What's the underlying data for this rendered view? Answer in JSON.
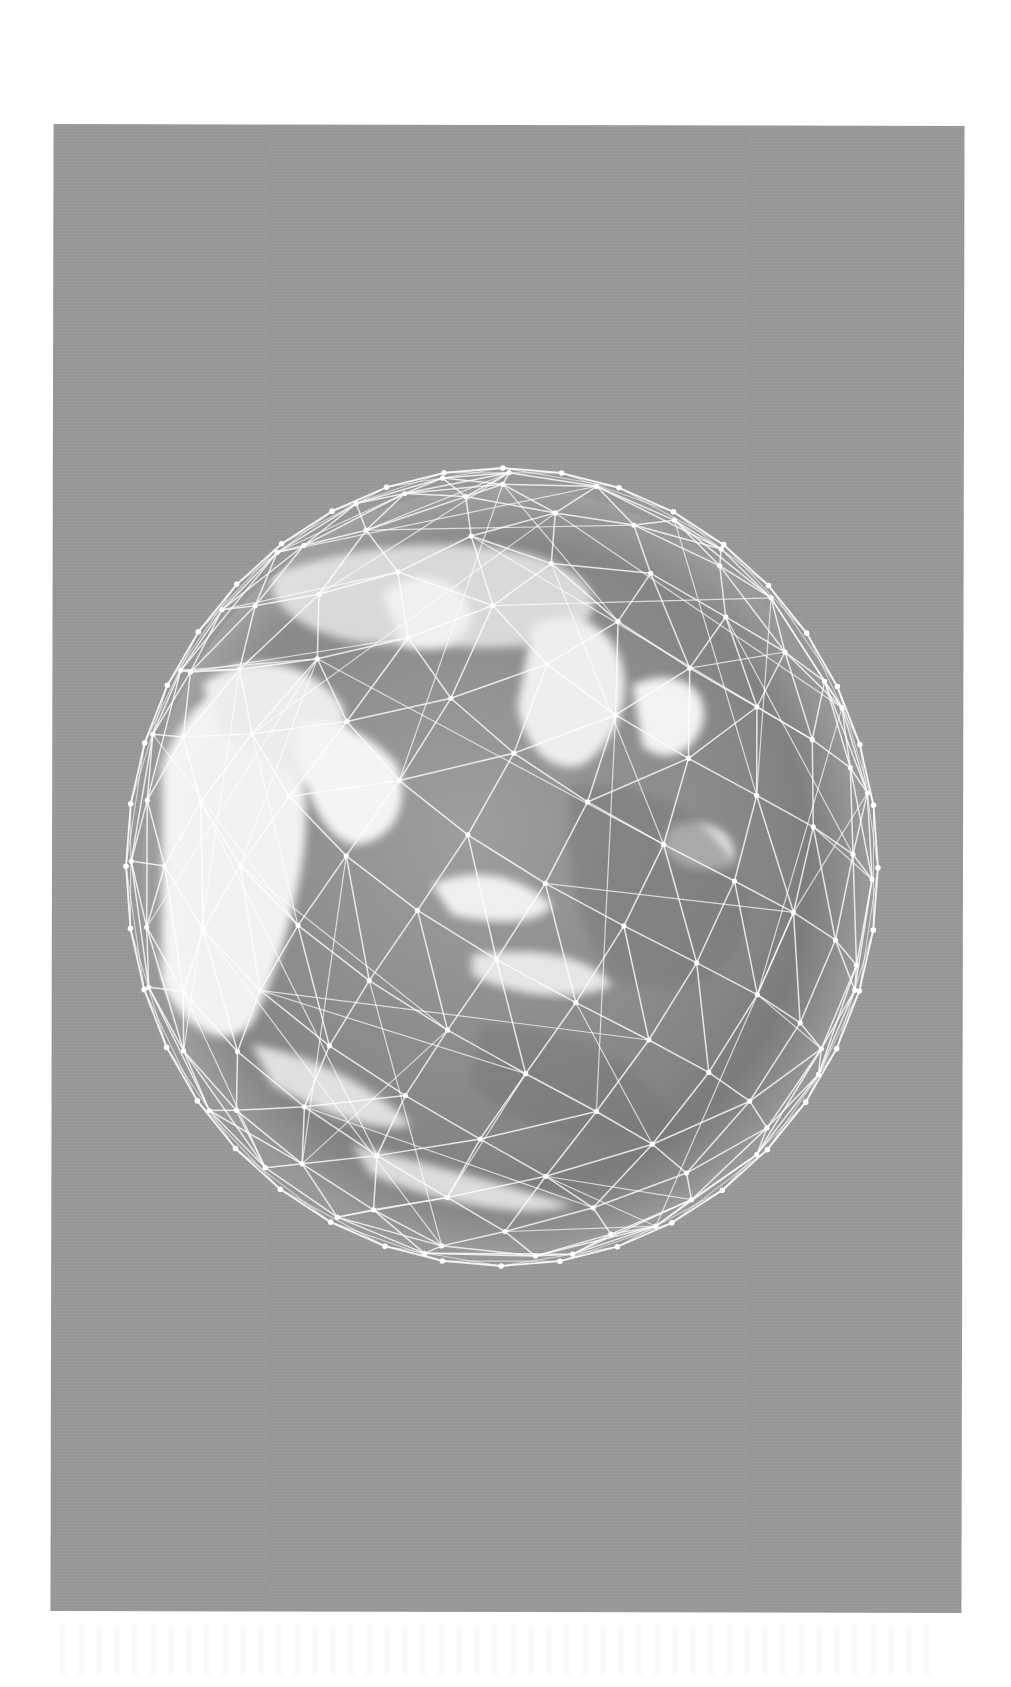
{
  "page": {
    "background_color": "#ffffff",
    "panel_color": "#9a9a9a"
  },
  "figure": {
    "description": "Grayscale photo of planet Earth viewed from space (Africa, Arabian Peninsula, Middle East, Indian Ocean, Asia visible) overlaid with a white geodesic wireframe network of nodes and connecting lines, on a mid-gray background",
    "globe_center": [
      502,
      867
    ],
    "globe_radius_x": 378,
    "globe_radius_y": 400,
    "wire_color": "#ffffff",
    "ocean_color": "#7c7c7c",
    "land_color": "#e8e8e8"
  }
}
